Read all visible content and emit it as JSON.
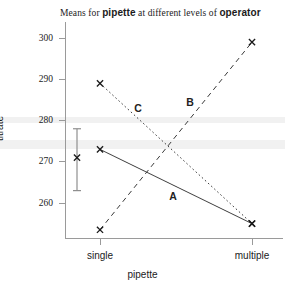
{
  "chart_data": {
    "type": "line",
    "title": "Means for pipette at different levels of operator",
    "title_parts": {
      "prefix": "Means for ",
      "emph1": "pipette",
      "middle": " at different levels of ",
      "emph2": "operator"
    },
    "xlabel": "pipette",
    "ylabel": "titrate",
    "categories": [
      "single",
      "multiple"
    ],
    "ytick_labels": [
      "300",
      "290",
      "280",
      "270",
      "260"
    ],
    "yticks": [
      300,
      290,
      280,
      270,
      260
    ],
    "ylim": [
      251,
      302
    ],
    "grid": false,
    "legend": "inline-labels",
    "series": [
      {
        "name": "A",
        "style": "solid",
        "values": [
          273.0,
          255.0
        ],
        "label_x": 173,
        "label_y": 196
      },
      {
        "name": "B",
        "style": "dashed",
        "values": [
          253.5,
          299.0
        ],
        "label_x": 190,
        "label_y": 102
      },
      {
        "name": "C",
        "style": "dotted",
        "values": [
          289.0,
          255.0
        ],
        "label_x": 138,
        "label_y": 108
      }
    ],
    "error_bar": {
      "center": 271.0,
      "upper": 278.0,
      "lower": 263.0,
      "marker": "x"
    },
    "marker": "x",
    "colors": {
      "line": "#3a3a3a",
      "axis": "#9a9a9a",
      "text": "#1b1b1b",
      "band": "#ececec"
    }
  }
}
